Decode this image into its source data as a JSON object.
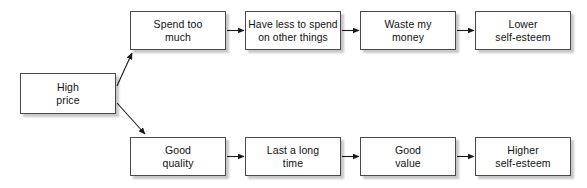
{
  "diagram": {
    "background_color": "#ffffff",
    "box_fill": "#ffffff",
    "box_border_color": "#4a4a4a",
    "shadow_color": "#bdbdbd",
    "arrow_color": "#1a1a1a",
    "nodes": [
      {
        "id": "high-price",
        "label": "High\nprice",
        "x": 20,
        "y": 73,
        "w": 96,
        "h": 41
      },
      {
        "id": "spend-too-much",
        "label": "Spend too\nmuch",
        "x": 130,
        "y": 11,
        "w": 96,
        "h": 39
      },
      {
        "id": "have-less-to-spend",
        "label": "Have less to spend\non other things",
        "x": 245,
        "y": 11,
        "w": 96,
        "h": 39
      },
      {
        "id": "waste-my-money",
        "label": "Waste my\nmoney",
        "x": 360,
        "y": 11,
        "w": 96,
        "h": 39
      },
      {
        "id": "lower-self-esteem",
        "label": "Lower\nself-esteem",
        "x": 475,
        "y": 11,
        "w": 96,
        "h": 39
      },
      {
        "id": "good-quality",
        "label": "Good\nquality",
        "x": 130,
        "y": 137,
        "w": 96,
        "h": 39
      },
      {
        "id": "last-a-long-time",
        "label": "Last a long\ntime",
        "x": 245,
        "y": 137,
        "w": 96,
        "h": 39
      },
      {
        "id": "good-value",
        "label": "Good\nvalue",
        "x": 360,
        "y": 137,
        "w": 96,
        "h": 39
      },
      {
        "id": "higher-self-esteem",
        "label": "Higher\nself-esteem",
        "x": 475,
        "y": 137,
        "w": 96,
        "h": 39
      }
    ],
    "edges": [
      {
        "id": "edge-high-price-to-spend-too-much",
        "from": "high-price",
        "to": "spend-too-much",
        "type": "diagonal-up"
      },
      {
        "id": "edge-high-price-to-good-quality",
        "from": "high-price",
        "to": "good-quality",
        "type": "diagonal-down"
      },
      {
        "id": "edge-spend-to-have-less",
        "from": "spend-too-much",
        "to": "have-less-to-spend",
        "type": "horizontal"
      },
      {
        "id": "edge-have-less-to-waste-money",
        "from": "have-less-to-spend",
        "to": "waste-my-money",
        "type": "horizontal"
      },
      {
        "id": "edge-waste-money-to-lower-self-esteem",
        "from": "waste-my-money",
        "to": "lower-self-esteem",
        "type": "horizontal"
      },
      {
        "id": "edge-good-quality-to-last-long",
        "from": "good-quality",
        "to": "last-a-long-time",
        "type": "horizontal"
      },
      {
        "id": "edge-last-long-to-good-value",
        "from": "last-a-long-time",
        "to": "good-value",
        "type": "horizontal"
      },
      {
        "id": "edge-good-value-to-higher-self-esteem",
        "from": "good-value",
        "to": "higher-self-esteem",
        "type": "horizontal"
      }
    ]
  }
}
